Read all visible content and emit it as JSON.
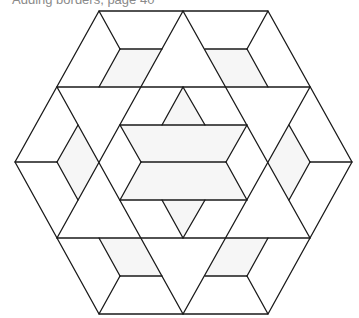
{
  "caption": "Adding borders, page 40",
  "colors": {
    "stroke": "#1a1a1a",
    "shade": "#f6f6f6",
    "background": "#ffffff",
    "caption": "#8a8a8a"
  },
  "diagram": {
    "type": "hexagonal quilt block (star of David with rhombi)",
    "hexagon": [
      [
        99,
        11
      ],
      [
        268,
        11
      ],
      [
        352,
        162
      ],
      [
        268,
        314
      ],
      [
        99,
        314
      ],
      [
        15,
        162
      ]
    ],
    "shaded_regions": [
      [
        [
          120,
          49
        ],
        [
          162,
          49
        ],
        [
          141,
          87
        ],
        [
          99,
          87
        ]
      ],
      [
        [
          205,
          49
        ],
        [
          247,
          49
        ],
        [
          268,
          87
        ],
        [
          226,
          87
        ]
      ],
      [
        [
          78,
          125
        ],
        [
          99,
          162
        ],
        [
          78,
          200
        ],
        [
          57,
          162
        ]
      ],
      [
        [
          289,
          125
        ],
        [
          310,
          162
        ],
        [
          289,
          200
        ],
        [
          268,
          162
        ]
      ],
      [
        [
          120,
          125
        ],
        [
          247,
          125
        ],
        [
          226,
          162
        ],
        [
          141,
          162
        ]
      ],
      [
        [
          141,
          162
        ],
        [
          226,
          162
        ],
        [
          247,
          200
        ],
        [
          120,
          200
        ]
      ],
      [
        [
          183,
          87
        ],
        [
          205,
          125
        ],
        [
          162,
          125
        ]
      ],
      [
        [
          162,
          200
        ],
        [
          205,
          200
        ],
        [
          183,
          238
        ]
      ],
      [
        [
          99,
          238
        ],
        [
          141,
          238
        ],
        [
          162,
          276
        ],
        [
          120,
          276
        ]
      ],
      [
        [
          226,
          238
        ],
        [
          268,
          238
        ],
        [
          247,
          276
        ],
        [
          205,
          276
        ]
      ]
    ],
    "lines": [
      [
        [
          57,
          87
        ],
        [
          310,
          87
        ]
      ],
      [
        [
          57,
          238
        ],
        [
          310,
          238
        ]
      ],
      [
        [
          183,
          11
        ],
        [
          57,
          238
        ]
      ],
      [
        [
          183,
          11
        ],
        [
          310,
          238
        ]
      ],
      [
        [
          57,
          87
        ],
        [
          183,
          314
        ]
      ],
      [
        [
          310,
          87
        ],
        [
          183,
          314
        ]
      ],
      [
        [
          99,
          11
        ],
        [
          120,
          49
        ]
      ],
      [
        [
          120,
          49
        ],
        [
          162,
          49
        ]
      ],
      [
        [
          120,
          49
        ],
        [
          99,
          87
        ]
      ],
      [
        [
          268,
          11
        ],
        [
          247,
          49
        ]
      ],
      [
        [
          205,
          49
        ],
        [
          247,
          49
        ]
      ],
      [
        [
          247,
          49
        ],
        [
          268,
          87
        ]
      ],
      [
        [
          15,
          162
        ],
        [
          57,
          162
        ]
      ],
      [
        [
          78,
          125
        ],
        [
          57,
          162
        ]
      ],
      [
        [
          57,
          162
        ],
        [
          78,
          200
        ]
      ],
      [
        [
          352,
          162
        ],
        [
          310,
          162
        ]
      ],
      [
        [
          289,
          125
        ],
        [
          310,
          162
        ]
      ],
      [
        [
          310,
          162
        ],
        [
          289,
          200
        ]
      ],
      [
        [
          120,
          125
        ],
        [
          247,
          125
        ]
      ],
      [
        [
          120,
          200
        ],
        [
          247,
          200
        ]
      ],
      [
        [
          141,
          162
        ],
        [
          226,
          162
        ]
      ],
      [
        [
          120,
          125
        ],
        [
          141,
          162
        ]
      ],
      [
        [
          141,
          162
        ],
        [
          120,
          200
        ]
      ],
      [
        [
          247,
          125
        ],
        [
          226,
          162
        ]
      ],
      [
        [
          226,
          162
        ],
        [
          247,
          200
        ]
      ],
      [
        [
          183,
          87
        ],
        [
          162,
          125
        ]
      ],
      [
        [
          183,
          87
        ],
        [
          205,
          125
        ]
      ],
      [
        [
          162,
          200
        ],
        [
          183,
          238
        ]
      ],
      [
        [
          205,
          200
        ],
        [
          183,
          238
        ]
      ],
      [
        [
          99,
          314
        ],
        [
          120,
          276
        ]
      ],
      [
        [
          120,
          276
        ],
        [
          162,
          276
        ]
      ],
      [
        [
          120,
          276
        ],
        [
          99,
          238
        ]
      ],
      [
        [
          268,
          314
        ],
        [
          247,
          276
        ]
      ],
      [
        [
          205,
          276
        ],
        [
          247,
          276
        ]
      ],
      [
        [
          247,
          276
        ],
        [
          268,
          238
        ]
      ]
    ]
  }
}
